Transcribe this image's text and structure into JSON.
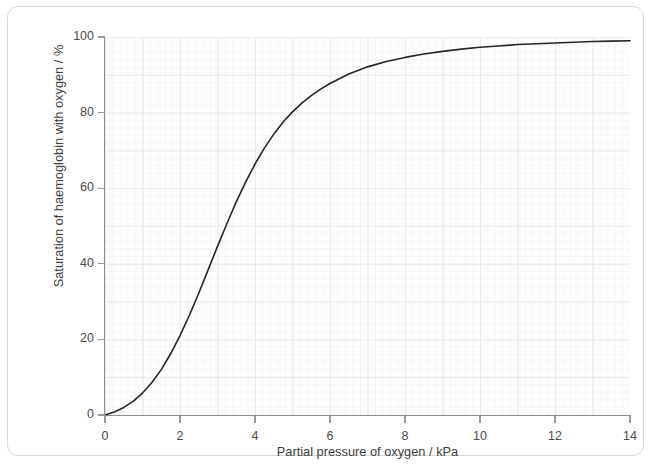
{
  "chart_data": {
    "type": "line",
    "title": "",
    "xlabel": "Partial pressure of oxygen / kPa",
    "ylabel": "Saturation of haemoglobin with oxygen / %",
    "xlim": [
      0,
      14
    ],
    "ylim": [
      0,
      100
    ],
    "xticks": [
      0,
      2,
      4,
      6,
      8,
      10,
      12,
      14
    ],
    "yticks": [
      0,
      20,
      40,
      60,
      80,
      100
    ],
    "xtick_labels": [
      "0",
      "2",
      "4",
      "6",
      "8",
      "10",
      "12",
      "14"
    ],
    "ytick_labels": [
      "0",
      "20",
      "40",
      "60",
      "80",
      "100"
    ],
    "grid": true,
    "grid_style": "graph-paper minor and major mesh",
    "legend": false,
    "legend_position": "none",
    "line_color": "#262626",
    "line_width": 1.6,
    "series": [
      {
        "name": "Oxygen dissociation curve",
        "x": [
          0.0,
          0.25,
          0.5,
          0.75,
          1.0,
          1.25,
          1.5,
          1.75,
          2.0,
          2.25,
          2.5,
          2.75,
          3.0,
          3.25,
          3.5,
          3.75,
          4.0,
          4.25,
          4.5,
          4.75,
          5.0,
          5.25,
          5.5,
          5.75,
          6.0,
          6.5,
          7.0,
          7.5,
          8.0,
          8.5,
          9.0,
          9.5,
          10.0,
          10.5,
          11.0,
          11.5,
          12.0,
          12.5,
          13.0,
          13.5,
          14.0
        ],
        "y": [
          0.0,
          0.8,
          2.0,
          3.6,
          5.8,
          8.6,
          12.0,
          16.2,
          21.0,
          26.4,
          32.2,
          38.4,
          44.6,
          50.6,
          56.4,
          61.6,
          66.4,
          70.6,
          74.3,
          77.5,
          80.2,
          82.5,
          84.5,
          86.2,
          87.7,
          90.2,
          92.1,
          93.5,
          94.6,
          95.5,
          96.2,
          96.8,
          97.3,
          97.6,
          98.0,
          98.2,
          98.4,
          98.6,
          98.8,
          98.9,
          99.0
        ]
      }
    ]
  },
  "axis": {
    "x_title": "Partial pressure of oxygen / kPa",
    "y_title": "Saturation of haemoglobin with oxygen / %"
  }
}
